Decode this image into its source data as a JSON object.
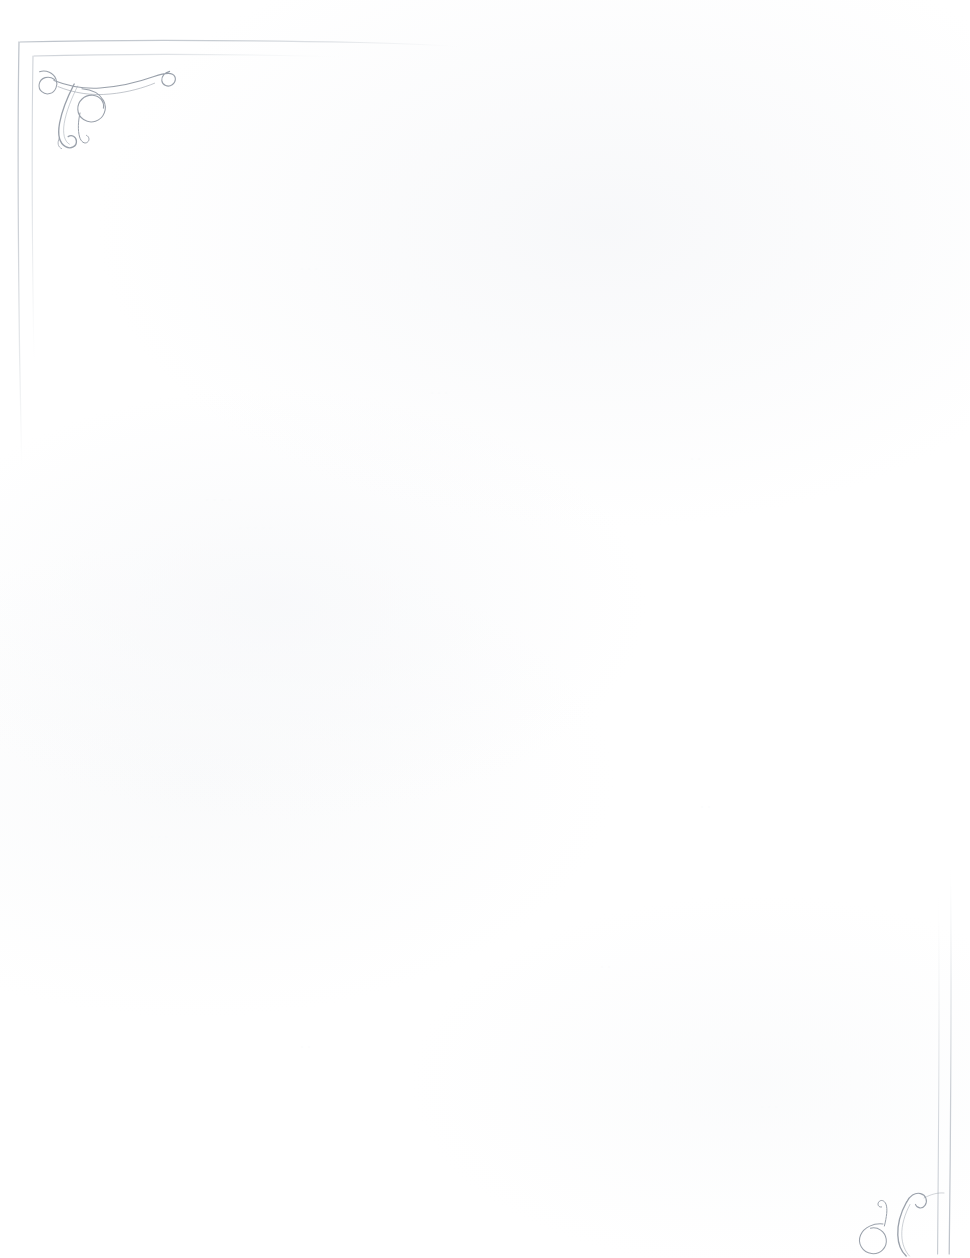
{
  "document": {
    "kind": "scanned-page",
    "title": "Blank ornamental page",
    "page_width": 970,
    "page_height": 1258,
    "background_color": "#ffffff",
    "ink_color": "#9aa1ab",
    "rule_color": "#c2c7ce",
    "body_text": ""
  },
  "ornaments": {
    "top_left": {
      "name": "corner-flourish-top-left",
      "description": "Calligraphic double-spiral flourish with long sweeping tail"
    },
    "bottom_right": {
      "name": "corner-flourish-bottom-right",
      "description": "Mirrored calligraphic flourish, clipped by page edge"
    }
  },
  "borders": {
    "top": {
      "name": "top-rule",
      "visible": true
    },
    "left": {
      "name": "left-rule",
      "visible": true
    },
    "right": {
      "name": "right-rule",
      "visible": true
    },
    "bottom": {
      "name": "bottom-rule",
      "visible": false
    }
  },
  "bleed_marks": [
    {
      "text": "·  ·   ·    ·",
      "x": 205,
      "y": 492,
      "size": 13,
      "rotate": -0.4
    },
    {
      "text": "·  ·  ·   ·  ·",
      "x": 238,
      "y": 520,
      "size": 13,
      "rotate": 0.2
    },
    {
      "text": "· · ·  ·",
      "x": 250,
      "y": 548,
      "size": 13,
      "rotate": -0.3
    },
    {
      "text": "· ·  ·  ·",
      "x": 246,
      "y": 578,
      "size": 14,
      "rotate": 0.3
    },
    {
      "text": "· ·  ·",
      "x": 252,
      "y": 608,
      "size": 14,
      "rotate": -0.2
    },
    {
      "text": "·  ·   ·   ·  ·",
      "x": 110,
      "y": 742,
      "size": 12,
      "rotate": 0.1
    },
    {
      "text": "· ·  ·   ·",
      "x": 178,
      "y": 760,
      "size": 12,
      "rotate": -0.2
    },
    {
      "text": "·  ·  ·",
      "x": 520,
      "y": 170,
      "size": 12,
      "rotate": 0.2
    },
    {
      "text": "· ·  ·   ·",
      "x": 536,
      "y": 196,
      "size": 12,
      "rotate": -0.1
    },
    {
      "text": "·  ·",
      "x": 560,
      "y": 222,
      "size": 12,
      "rotate": 0.2
    },
    {
      "text": "·  ·   ·",
      "x": 300,
      "y": 262,
      "size": 12,
      "rotate": -0.2
    },
    {
      "text": "· ·",
      "x": 640,
      "y": 334,
      "size": 12,
      "rotate": 0.1
    },
    {
      "text": "·  ·  ·",
      "x": 430,
      "y": 386,
      "size": 12,
      "rotate": -0.2
    },
    {
      "text": "·  ·",
      "x": 690,
      "y": 452,
      "size": 12,
      "rotate": 0.2
    },
    {
      "text": "· ·  ·",
      "x": 380,
      "y": 700,
      "size": 12,
      "rotate": -0.1
    },
    {
      "text": "·  ·",
      "x": 700,
      "y": 800,
      "size": 12,
      "rotate": 0.2
    },
    {
      "text": "· ·  ·",
      "x": 150,
      "y": 830,
      "size": 12,
      "rotate": -0.2
    },
    {
      "text": "·  ·",
      "x": 600,
      "y": 960,
      "size": 12,
      "rotate": 0.1
    },
    {
      "text": "· ·",
      "x": 300,
      "y": 1040,
      "size": 12,
      "rotate": -0.2
    },
    {
      "text": "·  ·  ·",
      "x": 760,
      "y": 1100,
      "size": 12,
      "rotate": 0.2
    }
  ]
}
